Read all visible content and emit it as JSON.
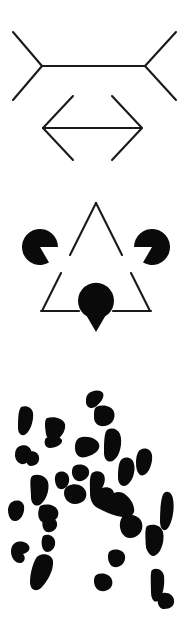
{
  "page": {
    "background_color": "#ffffff",
    "ink_color": "#0a0a0a",
    "line_color": "#1a1a1a",
    "width": 195,
    "height": 619
  },
  "figures": [
    {
      "id": "muller-lyer",
      "name": "Muller-Lyer illusion",
      "caption": "",
      "description": "Two horizontal shafts of equal length; the upper has outward-pointing fins, the lower has inward-pointing fins.",
      "elements": [
        {
          "name": "outward-fins-figure",
          "shaft": {
            "x1": 42,
            "y1": 66,
            "x2": 145,
            "y2": 66
          },
          "fins": [
            {
              "x1": 42,
              "y1": 66,
              "x2": 13,
              "y2": 32
            },
            {
              "x1": 42,
              "y1": 66,
              "x2": 13,
              "y2": 100
            },
            {
              "x1": 145,
              "y1": 66,
              "x2": 176,
              "y2": 32
            },
            {
              "x1": 145,
              "y1": 66,
              "x2": 176,
              "y2": 100
            }
          ]
        },
        {
          "name": "inward-fins-figure",
          "shaft": {
            "x1": 43,
            "y1": 128,
            "x2": 142,
            "y2": 128
          },
          "fins": [
            {
              "x1": 43,
              "y1": 128,
              "x2": 73,
              "y2": 96
            },
            {
              "x1": 43,
              "y1": 128,
              "x2": 73,
              "y2": 160
            },
            {
              "x1": 142,
              "y1": 128,
              "x2": 112,
              "y2": 96
            },
            {
              "x1": 142,
              "y1": 128,
              "x2": 112,
              "y2": 160
            }
          ]
        }
      ]
    },
    {
      "id": "kanizsa-triangle",
      "name": "Kanizsa triangle illusion",
      "caption": "",
      "description": "Three black pac-man discs and a broken outlined triangle create an illusory white triangle.",
      "pacmen": [
        {
          "name": "pacman-top-left",
          "cx": 40,
          "cy": 67,
          "r": 18,
          "notch_deg": 300
        },
        {
          "name": "pacman-top-right",
          "cx": 152,
          "cy": 67,
          "r": 18,
          "notch_deg": 180
        },
        {
          "name": "pacman-bottom",
          "cx": 96,
          "cy": 152,
          "r": 18,
          "notch_deg": 60
        }
      ],
      "outline_triangle": {
        "name": "outlined-triangle",
        "apex": {
          "x": 96,
          "y": 20
        },
        "bottom_left": {
          "x": 40,
          "y": 132
        },
        "bottom_right": {
          "x": 152,
          "y": 132
        }
      }
    },
    {
      "id": "dalmatian",
      "name": "Dalmatian dog emergence figure",
      "caption": "",
      "description": "Random-looking black blobs on white that resolve into a dalmatian dog sniffing the ground.",
      "blob_count": 31
    }
  ],
  "colors": {
    "ink": "#0a0a0a",
    "line": "#1a1a1a",
    "paper": "#ffffff"
  }
}
